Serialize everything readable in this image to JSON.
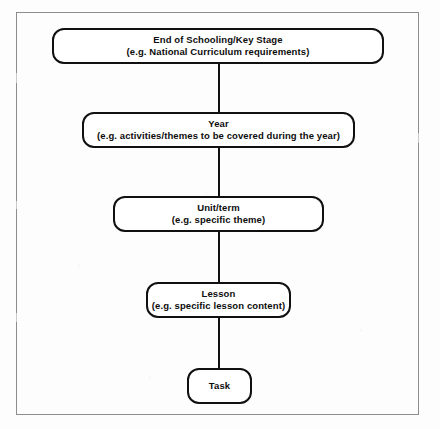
{
  "diagram": {
    "type": "flowchart",
    "orientation": "vertical-hierarchy",
    "colors": {
      "page_background": "#fdfdfd",
      "node_border": "#101010",
      "node_fill": "#ffffff",
      "connector": "#111111",
      "frame_border": "#8d8d8d",
      "text": "#0d0d0d"
    },
    "frame": {
      "x": 16,
      "y": 12,
      "width": 403,
      "height": 403
    },
    "nodes": [
      {
        "id": "end-of-schooling",
        "title": "End of Schooling/Key Stage",
        "subtitle": "(e.g. National Curriculum requirements)",
        "x": 52,
        "y": 28,
        "width": 332,
        "height": 36
      },
      {
        "id": "year",
        "title": "Year",
        "subtitle": "(e.g. activities/themes to be covered during the year)",
        "x": 82,
        "y": 112,
        "width": 273,
        "height": 36
      },
      {
        "id": "unit-term",
        "title": "Unit/term",
        "subtitle": "(e.g. specific theme)",
        "x": 113,
        "y": 196,
        "width": 211,
        "height": 36
      },
      {
        "id": "lesson",
        "title": "Lesson",
        "subtitle": "(e.g. specific lesson content)",
        "x": 146,
        "y": 282,
        "width": 145,
        "height": 36
      },
      {
        "id": "task",
        "title": "Task",
        "subtitle": "",
        "x": 187,
        "y": 368,
        "width": 65,
        "height": 36
      }
    ],
    "connectors": [
      {
        "id": "connector-end-to-year",
        "from": "end-of-schooling",
        "to": "year",
        "x": 218,
        "y": 64,
        "length": 48
      },
      {
        "id": "connector-year-to-unit",
        "from": "year",
        "to": "unit-term",
        "x": 218,
        "y": 148,
        "length": 48
      },
      {
        "id": "connector-unit-to-lesson",
        "from": "unit-term",
        "to": "lesson",
        "x": 218,
        "y": 232,
        "length": 50
      },
      {
        "id": "connector-lesson-to-task",
        "from": "lesson",
        "to": "task",
        "x": 218,
        "y": 318,
        "length": 50
      }
    ]
  }
}
